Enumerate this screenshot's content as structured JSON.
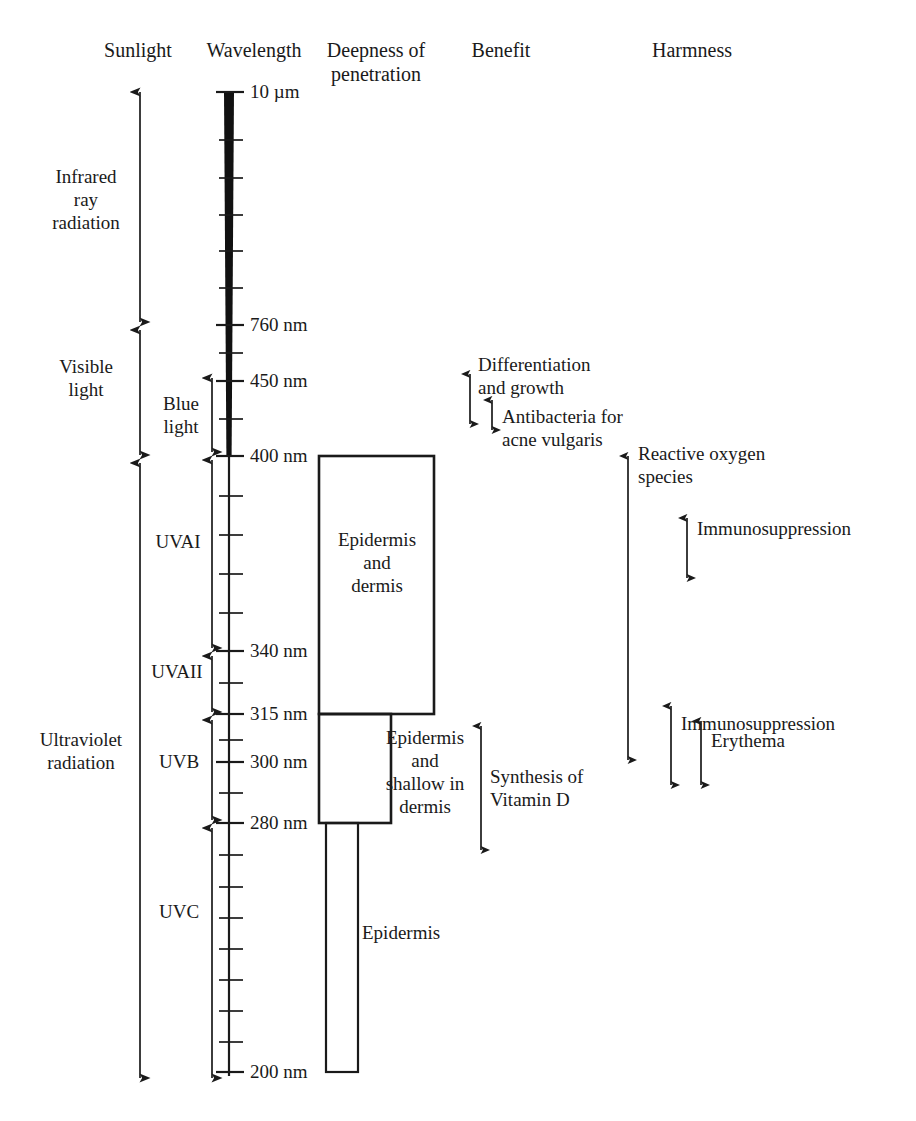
{
  "figure": {
    "type": "diagram"
  },
  "headers": {
    "sunlight": "Sunlight",
    "wavelength": "Wavelength",
    "deepness": "Deepness of\npenetration",
    "benefit": "Benefit",
    "harmness": "Harmness"
  },
  "sunlight_bands": [
    {
      "label": "Infrared\nray\nradiation"
    },
    {
      "label": "Visible\nlight"
    },
    {
      "label": "Ultraviolet\nradiation"
    }
  ],
  "sub_bands": [
    {
      "label": "Blue\nlight"
    },
    {
      "label": "UVAI"
    },
    {
      "label": "UVAII"
    },
    {
      "label": "UVB"
    },
    {
      "label": "UVC"
    }
  ],
  "wavelength_ticks": [
    {
      "label": "10 µm"
    },
    {
      "label": "760 nm"
    },
    {
      "label": "450 nm"
    },
    {
      "label": "400 nm"
    },
    {
      "label": "340 nm"
    },
    {
      "label": "315 nm"
    },
    {
      "label": "300 nm"
    },
    {
      "label": "280 nm"
    },
    {
      "label": "200 nm"
    }
  ],
  "penetration": [
    {
      "label": "Epidermis\nand\ndermis"
    },
    {
      "label": "Epidermis\nand\nshallow in\ndermis"
    },
    {
      "label": "Epidermis"
    }
  ],
  "benefits": [
    {
      "label": "Differentiation\nand growth"
    },
    {
      "label": "Antibacteria for\nacne vulgaris"
    },
    {
      "label": "Synthesis of\nVitamin D"
    }
  ],
  "harms": [
    {
      "label": "Reactive oxygen\nspecies"
    },
    {
      "label": "Immunosuppression"
    },
    {
      "label": "Immunosuppression"
    },
    {
      "label": "Erythema"
    }
  ],
  "colors": {
    "ink": "#1a1a1a",
    "background": "#ffffff"
  }
}
